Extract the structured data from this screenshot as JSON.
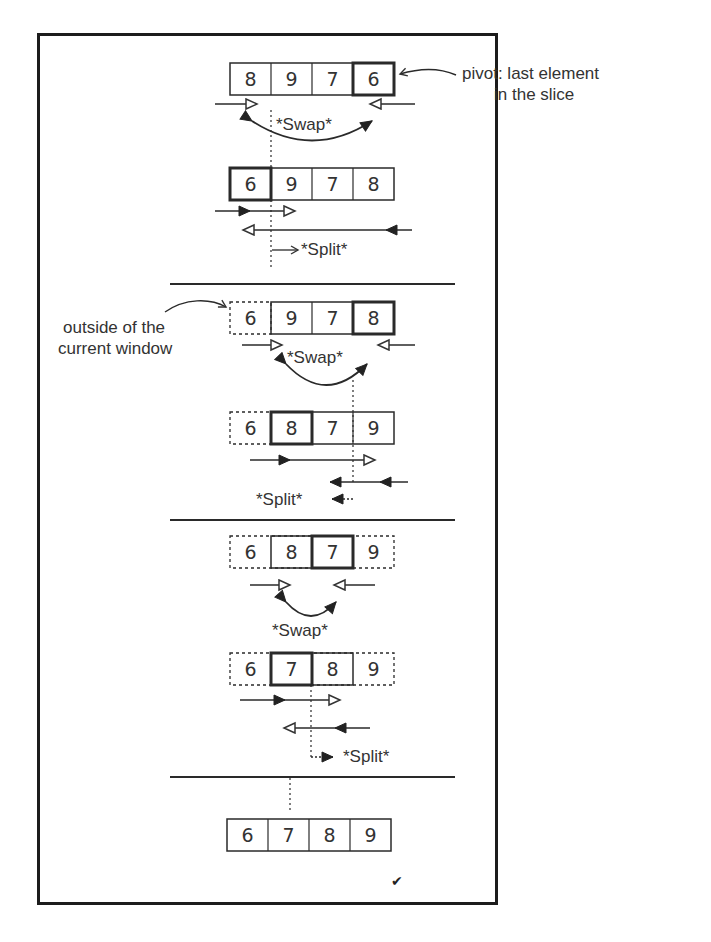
{
  "annotations": {
    "pivot_note_line1": "pivot: last element",
    "pivot_note_line2": "in the slice",
    "outside_note_line1": "outside of the",
    "outside_note_line2": "current window"
  },
  "labels": {
    "swap": "*Swap*",
    "split": "*Split*"
  },
  "stages": [
    {
      "rows": [
        {
          "cells": [
            "8",
            "9",
            "7",
            "6"
          ],
          "pivot_index": 3,
          "outside": []
        },
        {
          "cells": [
            "6",
            "9",
            "7",
            "8"
          ],
          "pivot_index": 0,
          "outside": []
        }
      ]
    },
    {
      "rows": [
        {
          "cells": [
            "6",
            "9",
            "7",
            "8"
          ],
          "pivot_index": 3,
          "outside": [
            0
          ]
        },
        {
          "cells": [
            "6",
            "8",
            "7",
            "9"
          ],
          "pivot_index": 1,
          "outside": [
            0
          ]
        }
      ]
    },
    {
      "rows": [
        {
          "cells": [
            "6",
            "8",
            "7",
            "9"
          ],
          "pivot_index": 2,
          "outside": [
            0,
            3
          ]
        },
        {
          "cells": [
            "6",
            "7",
            "8",
            "9"
          ],
          "pivot_index": 1,
          "outside": [
            0,
            3
          ]
        }
      ]
    },
    {
      "rows": [
        {
          "cells": [
            "6",
            "7",
            "8",
            "9"
          ],
          "pivot_index": -1,
          "outside": []
        }
      ]
    }
  ],
  "result_mark": "✔",
  "colors": {
    "stroke": "#2a2a2a",
    "frame": "#1c1c1c",
    "text": "#333333"
  }
}
